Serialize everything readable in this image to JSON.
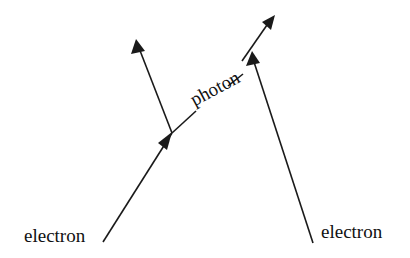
{
  "diagram": {
    "type": "feynman-diagram",
    "labels": {
      "left_electron": "electron",
      "right_electron": "electron",
      "photon": "photon"
    },
    "colors": {
      "line": "#1a1a1a",
      "background": "#ffffff",
      "text": "#111111"
    },
    "elements": {
      "incoming_electron_left": {
        "from": [
          103,
          242
        ],
        "to": [
          172,
          133
        ]
      },
      "outgoing_electron_left": {
        "from": [
          172,
          133
        ],
        "to": [
          136,
          40
        ]
      },
      "photon": {
        "from": [
          172,
          133
        ],
        "to": [
          275,
          14
        ],
        "style": "dashed"
      },
      "electron_right": {
        "from": [
          313,
          243
        ],
        "to": [
          252,
          52
        ]
      }
    }
  }
}
